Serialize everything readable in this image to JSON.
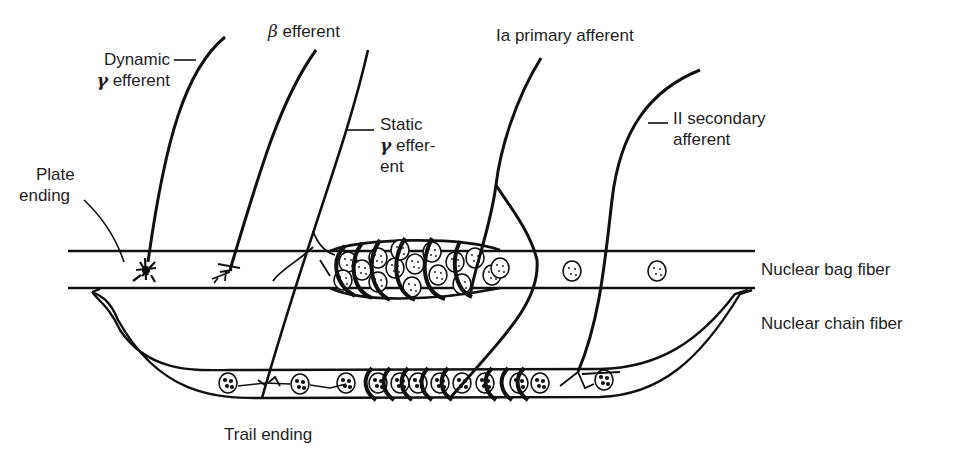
{
  "diagram": {
    "labels": {
      "dynamic_gamma": {
        "line1": "Dynamic",
        "greek": "γ",
        "line2": " efferent"
      },
      "beta_efferent": {
        "greek": "β",
        "text": " efferent"
      },
      "static_gamma": {
        "line1": "Static",
        "greek": "γ",
        "line2": " effer-",
        "line3": "ent"
      },
      "ia_primary": "Ia primary afferent",
      "ii_secondary": {
        "line1": "II secondary",
        "line2": "afferent"
      },
      "plate_ending": {
        "line1": "Plate",
        "line2": "ending"
      },
      "nuclear_bag": "Nuclear bag fiber",
      "nuclear_chain": "Nuclear chain fiber",
      "trail_ending": "Trail ending"
    },
    "colors": {
      "ink": "#111111",
      "text": "#1e1e1e",
      "background": "#ffffff"
    }
  }
}
